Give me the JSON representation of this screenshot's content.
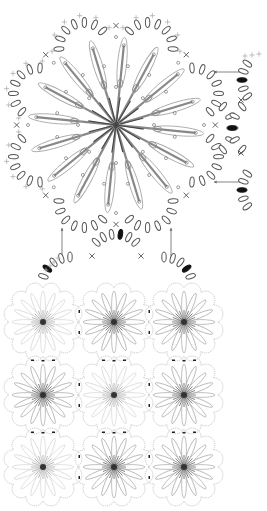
{
  "diagram": {
    "type": "crochet-chart",
    "colors": {
      "background": "#ffffff",
      "chain": "#555555",
      "stitch_long": "#888888",
      "stitch_long_dark": "#444444",
      "loop": "#aaaaaa",
      "edge_cross": "#b0b0b0",
      "join_chain": "#111111",
      "arrow": "#666666",
      "dot": "#777777"
    },
    "main_motif": {
      "center": [
        116,
        125
      ],
      "radius": 108,
      "petals": 8,
      "radial_stitches": 16,
      "symbols": [
        "chain-oval",
        "single-crochet-x",
        "treble-long-stitch",
        "slip-stitch-dot",
        "joining-chain-filled"
      ]
    },
    "join_details": [
      {
        "name": "right-join-top",
        "arrow_from": [
          243,
          72
        ],
        "arrow_to": [
          214,
          72
        ]
      },
      {
        "name": "right-join-bottom",
        "arrow_from": [
          243,
          182
        ],
        "arrow_to": [
          214,
          182
        ]
      },
      {
        "name": "bottom-join-left",
        "arrow_from": [
          62,
          258
        ],
        "arrow_to": [
          62,
          228
        ]
      },
      {
        "name": "bottom-join-right",
        "arrow_from": [
          171,
          258
        ],
        "arrow_to": [
          171,
          228
        ]
      }
    ],
    "layout_grid": {
      "rows": 3,
      "cols": 3,
      "centers_x": [
        43,
        114,
        184
      ],
      "centers_y": [
        322,
        395,
        467
      ],
      "radius": 34,
      "scallops": 12
    }
  }
}
